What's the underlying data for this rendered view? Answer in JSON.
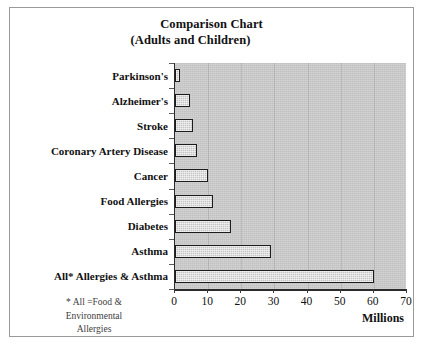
{
  "figure": {
    "title_line1": "Comparison Chart",
    "title_line2": "(Adults and Children)",
    "units_label": "Millions",
    "footnote_line1": "* All =Food &",
    "footnote_line2": "Environmental",
    "footnote_line3": "Allergies",
    "colors": {
      "plot_background": "#c9c9c9",
      "bar_fill": "#c4c4c4",
      "bar_border": "#1c1c1c",
      "axis": "#2a2a2a",
      "gridline": "#b4b4b4",
      "frame_border": "#9a9a9a",
      "text": "#111111"
    }
  },
  "chart_data": {
    "type": "bar",
    "orientation": "horizontal",
    "title": "Comparison Chart (Adults and Children)",
    "xlabel": "Millions",
    "ylabel": "",
    "xlim": [
      0,
      70
    ],
    "xticks": [
      0,
      10,
      20,
      30,
      40,
      50,
      60,
      70
    ],
    "xticklabels": [
      "0",
      "10",
      "20",
      "30",
      "40",
      "50",
      "60",
      "70"
    ],
    "grid": true,
    "legend": false,
    "categories": [
      "Parkinson's",
      "Alzheimer's",
      "Stroke",
      "Coronary Artery Disease",
      "Cancer",
      "Food Allergies",
      "Diabetes",
      "Asthma",
      "All* Allergies & Asthma"
    ],
    "values": [
      1.5,
      4.5,
      5.5,
      6.5,
      10,
      11.5,
      17,
      29,
      60
    ],
    "annotations": [
      "* All =Food & Environmental Allergies"
    ]
  }
}
